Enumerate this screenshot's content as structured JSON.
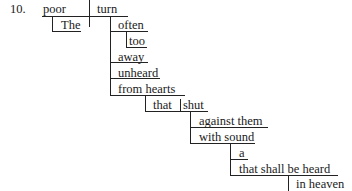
{
  "diagram": {
    "type": "sentence-diagram",
    "number": "10.",
    "subject": "poor",
    "verb": "turn",
    "modifiers": {
      "subject_article": "The",
      "verb_adverbs": [
        "often",
        "too",
        "away",
        "unheard"
      ],
      "prepositional_phrase": "from hearts",
      "relative_clause": {
        "subject": "that",
        "verb": "shut",
        "modifiers": [
          "against them",
          "with sound"
        ]
      },
      "sound_modifiers": [
        "a",
        "that shall be heard"
      ],
      "heard_modifier": "in heaven"
    },
    "words": {
      "num": "10.",
      "poor": "poor",
      "turn": "turn",
      "the": "The",
      "often": "often",
      "too": "too",
      "away": "away",
      "unheard": "unheard",
      "from_hearts": "from hearts",
      "that1": "that",
      "shut": "shut",
      "against_them": "against them",
      "with_sound": "with sound",
      "a": "a",
      "that_shall": "that shall be heard",
      "in_heaven": "in heaven"
    }
  }
}
